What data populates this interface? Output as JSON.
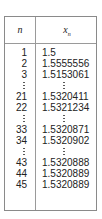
{
  "table": {
    "headers": {
      "n": "n",
      "x": "x",
      "x_sub": "n"
    },
    "rows": [
      {
        "n": "1",
        "x": "1.5"
      },
      {
        "n": "2",
        "x": "1.5555556"
      },
      {
        "n": "3",
        "x": "1.5153061"
      },
      {
        "ellipsis": true
      },
      {
        "n": "21",
        "x": "1.5320411"
      },
      {
        "n": "22",
        "x": "1.5321234"
      },
      {
        "ellipsis": true
      },
      {
        "n": "33",
        "x": "1.5320871"
      },
      {
        "n": "34",
        "x": "1.5320902"
      },
      {
        "ellipsis": true
      },
      {
        "n": "43",
        "x": "1.5320888"
      },
      {
        "n": "44",
        "x": "1.5320889"
      },
      {
        "n": "45",
        "x": "1.5320889"
      }
    ]
  }
}
